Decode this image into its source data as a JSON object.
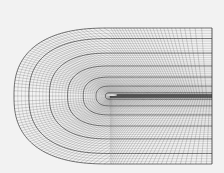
{
  "figure": {
    "background": "#f2f2f2",
    "line_color": "#3a3a3a",
    "major_line_color": "#222222",
    "outer_boundary": {
      "left": 14,
      "right": 212,
      "top": 28,
      "bottom": 164
    },
    "leading_edge": {
      "x": 110,
      "y": 96
    },
    "radial_lines": 130,
    "wrap_lines": 40,
    "major_every": 6
  }
}
